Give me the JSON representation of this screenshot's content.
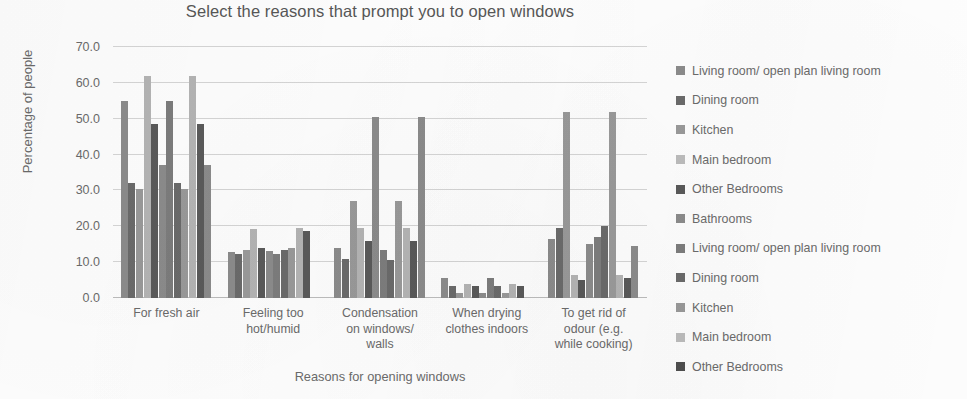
{
  "chart_data": {
    "type": "bar",
    "title": "Select the reasons that prompt you to open windows",
    "xlabel": "Reasons for opening windows",
    "ylabel": "Percentage of people",
    "ylim": [
      0,
      70
    ],
    "yticks": [
      "0.0",
      "10.0",
      "20.0",
      "30.0",
      "40.0",
      "50.0",
      "60.0",
      "70.0"
    ],
    "ytick_values": [
      0,
      10,
      20,
      30,
      40,
      50,
      60,
      70
    ],
    "grid": true,
    "legend_position": "right",
    "categories": [
      "For fresh air",
      "Feeling too hot/humid",
      "Condensation on windows/ walls",
      "When drying clothes indoors",
      "To get rid of odour (e.g. while cooking)"
    ],
    "category_lines": [
      [
        "For fresh air"
      ],
      [
        "Feeling too",
        "hot/humid"
      ],
      [
        "Condensation",
        "on windows/",
        "walls"
      ],
      [
        "When drying",
        "clothes indoors"
      ],
      [
        "To get rid of",
        "odour (e.g.",
        "while cooking)"
      ]
    ],
    "series": [
      {
        "name": "Living room/ open plan living room",
        "color": "#8c8c8c",
        "values": [
          55.0,
          12.8,
          14.0,
          5.5,
          16.5
        ]
      },
      {
        "name": "Dining room",
        "color": "#6b6b6b",
        "values": [
          32.0,
          12.3,
          11.0,
          3.3,
          19.5
        ]
      },
      {
        "name": "Kitchen",
        "color": "#9a9a9a",
        "values": [
          30.5,
          13.3,
          27.0,
          1.5,
          52.0
        ]
      },
      {
        "name": "Main bedroom",
        "color": "#b5b5b5",
        "values": [
          62.0,
          19.3,
          19.5,
          4.0,
          6.5
        ]
      },
      {
        "name": "Other Bedrooms",
        "color": "#5a5a5a",
        "values": [
          48.5,
          14.0,
          16.0,
          3.3,
          5.0
        ]
      },
      {
        "name": "Bathrooms",
        "color": "#8c8c8c",
        "values": [
          37.0,
          13.0,
          50.5,
          1.5,
          15.0
        ]
      },
      {
        "name": "Living room/ open plan living room",
        "color": "#7d7d7d",
        "values": [
          55.0,
          12.3,
          13.5,
          5.5,
          17.0
        ]
      },
      {
        "name": "Dining room",
        "color": "#6b6b6b",
        "values": [
          32.0,
          13.3,
          10.5,
          3.3,
          20.0
        ]
      },
      {
        "name": "Kitchen",
        "color": "#9a9a9a",
        "values": [
          30.5,
          14.0,
          27.0,
          1.5,
          52.0
        ]
      },
      {
        "name": "Main bedroom",
        "color": "#b5b5b5",
        "values": [
          62.0,
          19.5,
          19.5,
          4.0,
          6.5
        ]
      },
      {
        "name": "Other Bedrooms",
        "color": "#5a5a5a",
        "values": [
          48.5,
          18.8,
          16.0,
          3.3,
          5.5
        ]
      },
      {
        "name": "Bathrooms",
        "color": "#8c8c8c",
        "values": [
          37.0,
          0.0,
          50.5,
          0.0,
          14.5
        ]
      }
    ]
  },
  "legend": {
    "items": [
      {
        "label": "Living room/ open plan living room",
        "color": "#8c8c8c"
      },
      {
        "label": "Dining room",
        "color": "#6b6b6b"
      },
      {
        "label": "Kitchen",
        "color": "#9a9a9a"
      },
      {
        "label": "Main bedroom",
        "color": "#bdbdbd"
      },
      {
        "label": "Other Bedrooms",
        "color": "#5a5a5a"
      },
      {
        "label": "Bathrooms",
        "color": "#8c8c8c"
      },
      {
        "label": "Living room/ open plan living room",
        "color": "#7d7d7d"
      },
      {
        "label": "Dining room",
        "color": "#6b6b6b"
      },
      {
        "label": "Kitchen",
        "color": "#9a9a9a"
      },
      {
        "label": "Main bedroom",
        "color": "#bdbdbd"
      },
      {
        "label": "Other Bedrooms",
        "color": "#4f4f4f"
      }
    ]
  }
}
